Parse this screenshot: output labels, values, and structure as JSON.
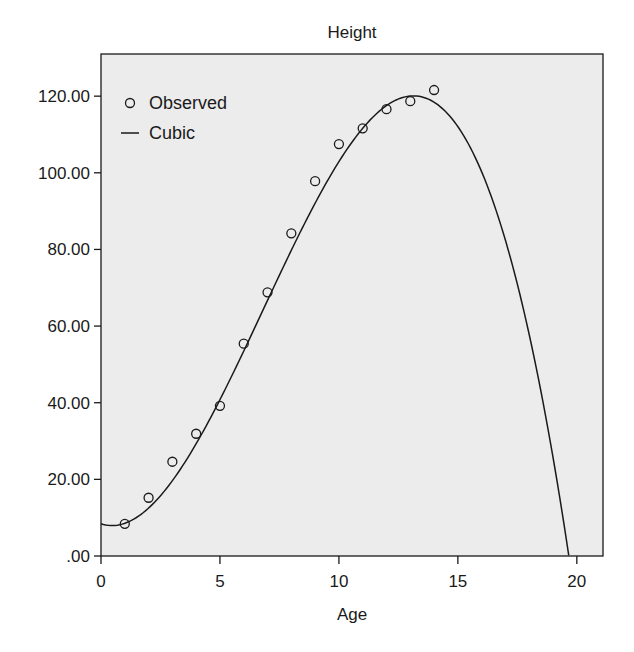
{
  "chart_data": {
    "type": "scatter",
    "title": "Height",
    "xlabel": "Age",
    "ylabel": "",
    "xlim": [
      0,
      21.1
    ],
    "ylim": [
      0,
      131
    ],
    "x_ticks": [
      0,
      5,
      10,
      15,
      20
    ],
    "x_tick_labels": [
      "0",
      "5",
      "10",
      "15",
      "20"
    ],
    "y_ticks": [
      0,
      20,
      40,
      60,
      80,
      100,
      120
    ],
    "y_tick_labels": [
      ".00",
      "20.00",
      "40.00",
      "60.00",
      "80.00",
      "100.00",
      "120.00"
    ],
    "grid": false,
    "legend_position": "upper-left-inside",
    "legend": [
      {
        "label": "Observed",
        "marker": "circle"
      },
      {
        "label": "Cubic",
        "marker": "line"
      }
    ],
    "series": [
      {
        "name": "Observed",
        "kind": "scatter",
        "x": [
          1,
          2,
          3,
          4,
          5,
          6,
          7,
          8,
          9,
          10,
          11,
          12,
          13,
          14
        ],
        "y": [
          8.4,
          15.2,
          24.6,
          31.9,
          39.2,
          55.4,
          68.8,
          84.2,
          97.8,
          107.5,
          111.6,
          116.6,
          118.7,
          121.6
        ]
      },
      {
        "name": "Cubic",
        "kind": "line",
        "coefficients": {
          "b0": 8.4,
          "b1": -2.0,
          "b2": 2.247,
          "b3": -0.1102
        },
        "x_range": [
          0,
          19.66
        ]
      }
    ],
    "colors": {
      "plot_background": "#ececec",
      "ink": "#1a1a1a"
    }
  }
}
